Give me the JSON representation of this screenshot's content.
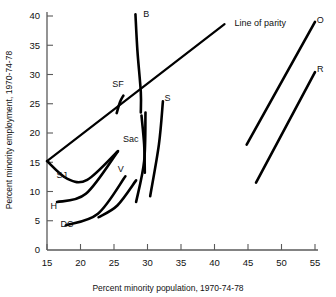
{
  "chart_data": {
    "type": "line",
    "title": "",
    "xlabel": "Percent minority population, 1970-74-78",
    "ylabel": "Percent minority employment, 1970-74-78",
    "xlim": [
      15,
      55
    ],
    "ylim": [
      0,
      40
    ],
    "xticks": [
      15,
      20,
      25,
      30,
      35,
      40,
      45,
      50,
      55
    ],
    "yticks": [
      0,
      5,
      10,
      15,
      20,
      25,
      30,
      35,
      40
    ],
    "grid": false,
    "legend": "none",
    "annotations": [
      {
        "name": "line-of-parity",
        "label": "Line of parity",
        "points": [
          [
            15,
            15.2
          ],
          [
            41.5,
            38.6
          ]
        ],
        "label_x": 43.0,
        "label_y": 38.9
      }
    ],
    "series": [
      {
        "name": "B",
        "label": "B",
        "points": [
          [
            28.2,
            40.3
          ],
          [
            28.5,
            34.0
          ],
          [
            29.0,
            27.0
          ],
          [
            29.0,
            23.5
          ]
        ],
        "label_x": 29.8,
        "label_y": 40.3
      },
      {
        "name": "SF",
        "label": "SF",
        "points": [
          [
            26.4,
            26.4
          ],
          [
            25.9,
            25.3
          ],
          [
            25.4,
            23.4
          ]
        ],
        "label_x": 25.6,
        "label_y": 28.4
      },
      {
        "name": "Sac",
        "label": "Sac",
        "points": [
          [
            29.1,
            23.0
          ],
          [
            29.5,
            18.0
          ],
          [
            29.6,
            13.2
          ]
        ],
        "label_x": 27.5,
        "label_y": 19.0
      },
      {
        "name": "S",
        "label": "S",
        "points": [
          [
            32.3,
            25.4
          ],
          [
            31.7,
            18.0
          ],
          [
            30.4,
            9.2
          ]
        ],
        "label_x": 33.0,
        "label_y": 26.0
      },
      {
        "name": "SJ",
        "label": "SJ",
        "points": [
          [
            15.0,
            15.2
          ],
          [
            18.0,
            12.2
          ],
          [
            21.0,
            12.0
          ],
          [
            25.5,
            16.8
          ]
        ],
        "label_x": 17.2,
        "label_y": 12.8
      },
      {
        "name": "H",
        "label": "H",
        "points": [
          [
            16.5,
            8.2
          ],
          [
            20.8,
            9.6
          ],
          [
            25.6,
            16.9
          ]
        ],
        "label_x": 16.0,
        "label_y": 7.6
      },
      {
        "name": "V",
        "label": "V",
        "points": [
          [
            17.8,
            4.2
          ],
          [
            22.6,
            6.2
          ],
          [
            26.7,
            12.6
          ]
        ],
        "label_x": 26.0,
        "label_y": 13.9
      },
      {
        "name": "DC",
        "label": "DC",
        "points": [
          [
            22.7,
            5.6
          ],
          [
            25.5,
            7.6
          ],
          [
            28.3,
            11.9
          ]
        ],
        "label_x": 18.0,
        "label_y": 4.5
      },
      {
        "name": "V2",
        "label": "",
        "points": [
          [
            28.3,
            8.2
          ],
          [
            29.5,
            15.2
          ],
          [
            29.7,
            23.5
          ]
        ],
        "label_x": null,
        "label_y": null
      },
      {
        "name": "O",
        "label": "O",
        "points": [
          [
            44.8,
            18.0
          ],
          [
            55.0,
            39.0
          ]
        ],
        "label_x": 55.8,
        "label_y": 39.4
      },
      {
        "name": "R",
        "label": "R",
        "points": [
          [
            46.2,
            11.5
          ],
          [
            55.0,
            30.4
          ]
        ],
        "label_x": 55.8,
        "label_y": 31.0
      }
    ]
  }
}
